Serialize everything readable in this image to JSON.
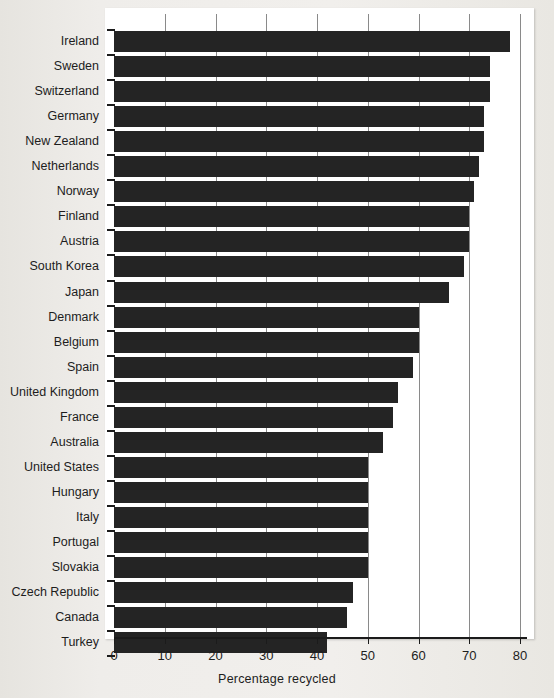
{
  "chart_data": {
    "type": "bar",
    "orientation": "horizontal",
    "title": "",
    "xlabel": "Percentage recycled",
    "ylabel": "",
    "xlim": [
      0,
      80
    ],
    "xticks": [
      0,
      10,
      20,
      30,
      40,
      50,
      60,
      70,
      80
    ],
    "grid": "vertical",
    "legend": "none",
    "bar_color": "#242424",
    "panel_color": "#ffffff",
    "background_color": "#eeece8",
    "categories": [
      "Ireland",
      "Sweden",
      "Switzerland",
      "Germany",
      "New Zealand",
      "Netherlands",
      "Norway",
      "Finland",
      "Austria",
      "South Korea",
      "Japan",
      "Denmark",
      "Belgium",
      "Spain",
      "United Kingdom",
      "France",
      "Australia",
      "United States",
      "Hungary",
      "Italy",
      "Portugal",
      "Slovakia",
      "Czech Republic",
      "Canada",
      "Turkey"
    ],
    "values": [
      78,
      74,
      74,
      73,
      73,
      72,
      71,
      70,
      70,
      69,
      66,
      60,
      60,
      59,
      56,
      55,
      53,
      50,
      50,
      50,
      50,
      50,
      47,
      46,
      42
    ]
  }
}
